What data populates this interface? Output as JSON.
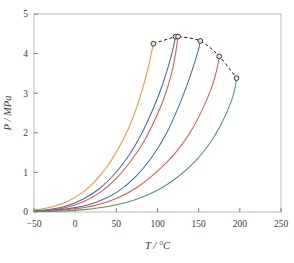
{
  "figure": {
    "background": "#ffffff",
    "frame_color": "#b9b9b9",
    "tick_color": "#6f6f6f",
    "text_color": "#3a3a3a"
  },
  "chart_data": {
    "type": "line",
    "title": "",
    "xlabel": "T / °C",
    "ylabel": "P / MPa",
    "xlim": [
      -50,
      250
    ],
    "ylim": [
      0,
      5
    ],
    "xticks": [
      -50,
      0,
      50,
      100,
      150,
      200,
      250
    ],
    "xtick_labels": [
      "−50",
      "0",
      "50",
      "100",
      "150",
      "200",
      "250"
    ],
    "yticks": [
      0,
      1,
      2,
      3,
      4,
      5
    ],
    "ytick_labels": [
      "0",
      "1",
      "2",
      "3",
      "4",
      "5"
    ],
    "grid": false,
    "legend": "none",
    "series": [
      {
        "name": "vapor-pressure-curve-1",
        "color": "#f0972e",
        "x": [
          -50,
          -30,
          -10,
          10,
          25,
          40,
          55,
          65,
          75,
          82,
          88,
          92,
          95
        ],
        "y": [
          0.05,
          0.12,
          0.26,
          0.51,
          0.8,
          1.18,
          1.7,
          2.12,
          2.66,
          3.12,
          3.58,
          3.95,
          4.25
        ]
      },
      {
        "name": "vapor-pressure-curve-2",
        "color": "#3b6ea5",
        "x": [
          -50,
          -30,
          -10,
          10,
          30,
          50,
          65,
          80,
          95,
          105,
          113,
          118,
          122
        ],
        "y": [
          0.03,
          0.07,
          0.16,
          0.33,
          0.6,
          1.01,
          1.42,
          1.95,
          2.62,
          3.15,
          3.67,
          4.05,
          4.43
        ]
      },
      {
        "name": "vapor-pressure-curve-3",
        "color": "#e0564a",
        "x": [
          -50,
          -30,
          -10,
          10,
          30,
          50,
          68,
          84,
          98,
          108,
          116,
          121,
          125
        ],
        "y": [
          0.02,
          0.05,
          0.12,
          0.26,
          0.49,
          0.85,
          1.3,
          1.8,
          2.38,
          2.88,
          3.41,
          3.88,
          4.43
        ]
      },
      {
        "name": "vapor-pressure-curve-4",
        "color": "#3b6ea5",
        "x": [
          -50,
          -25,
          0,
          25,
          50,
          72,
          92,
          110,
          126,
          138,
          146,
          150,
          152
        ],
        "y": [
          0.02,
          0.05,
          0.11,
          0.24,
          0.49,
          0.86,
          1.35,
          1.95,
          2.68,
          3.33,
          3.84,
          4.12,
          4.32
        ]
      },
      {
        "name": "vapor-pressure-curve-5",
        "color": "#e0564a",
        "x": [
          -50,
          -25,
          0,
          25,
          50,
          75,
          100,
          122,
          140,
          155,
          166,
          172,
          175
        ],
        "y": [
          0.01,
          0.03,
          0.08,
          0.17,
          0.34,
          0.62,
          1.03,
          1.5,
          2.02,
          2.61,
          3.16,
          3.59,
          3.93
        ]
      },
      {
        "name": "vapor-pressure-curve-6",
        "color": "#4e9a62",
        "x": [
          -50,
          -20,
          10,
          40,
          70,
          100,
          125,
          148,
          165,
          180,
          190,
          194,
          196
        ],
        "y": [
          0.01,
          0.02,
          0.06,
          0.14,
          0.29,
          0.55,
          0.89,
          1.33,
          1.78,
          2.33,
          2.82,
          3.12,
          3.38
        ]
      }
    ],
    "critical_locus": {
      "name": "critical-locus",
      "style": "dashed",
      "color": "#1a1a1a",
      "marker": "open-circle",
      "points": [
        {
          "x": 95,
          "y": 4.25
        },
        {
          "x": 122,
          "y": 4.43
        },
        {
          "x": 125,
          "y": 4.43
        },
        {
          "x": 152,
          "y": 4.32
        },
        {
          "x": 175,
          "y": 3.93
        },
        {
          "x": 196,
          "y": 3.38
        }
      ]
    }
  }
}
